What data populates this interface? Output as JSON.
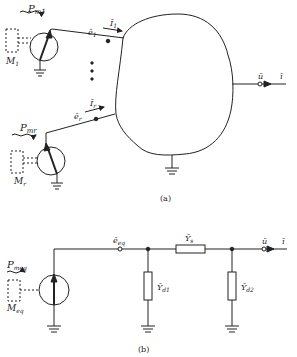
{
  "figure_a": {
    "caption": "(a)",
    "machine1": {
      "power_label": "P",
      "power_sub": "m1",
      "machine_label": "M",
      "machine_sub": "1",
      "emf_label": "ē",
      "emf_sub": "1",
      "current_label": "Ī",
      "current_sub": "1"
    },
    "machiner": {
      "power_label": "P",
      "power_sub": "mr",
      "machine_label": "M",
      "machine_sub": "r",
      "emf_label": "ē",
      "emf_sub": "r",
      "current_label": "Ī",
      "current_sub": "r"
    },
    "output": {
      "voltage_label": "ū",
      "current_label": "ī"
    },
    "ellipsis": "⋮"
  },
  "figure_b": {
    "caption": "(b)",
    "machine": {
      "power_label": "P",
      "power_sub": "meq",
      "machine_label": "M",
      "machine_sub": "eq",
      "emf_label": "ē",
      "emf_sub": "eq"
    },
    "series_admittance": {
      "label": "Ȳ",
      "sub": "s"
    },
    "shunt1": {
      "label": "Ȳ",
      "sub": "d1"
    },
    "shunt2": {
      "label": "Ȳ",
      "sub": "d2"
    },
    "output": {
      "voltage_label": "ū",
      "current_label": "ī"
    }
  },
  "colors": {
    "line": "#222222",
    "background": "#ffffff"
  }
}
